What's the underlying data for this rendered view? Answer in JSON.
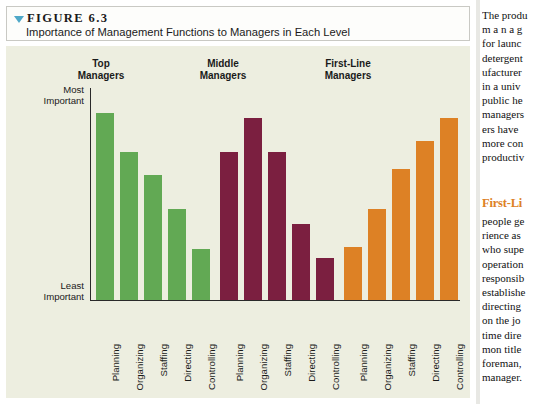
{
  "figure": {
    "label": "FIGURE 6.3",
    "caption": "Importance of Management Functions to Managers in Each Level",
    "disclosure_icon": "triangle-down-icon"
  },
  "colors": {
    "green": "#62a954",
    "maroon": "#7b1f40",
    "orange": "#dd8125",
    "panel_bg": "#edeee0",
    "accent_triangle": "#4fa8c8",
    "heading_orange": "#dd8125"
  },
  "chart_data": {
    "type": "bar",
    "title": "Importance of Management Functions to Managers in Each Level",
    "xlabel": "",
    "ylabel": "",
    "ylim": [
      0,
      100
    ],
    "grid": false,
    "legend": "none",
    "y_axis_ticks": [
      {
        "pos": "top",
        "line1": "Most",
        "line2": "Important"
      },
      {
        "pos": "bottom",
        "line1": "Least",
        "line2": "Important"
      }
    ],
    "categories": [
      "Planning",
      "Organizing",
      "Staffing",
      "Directing",
      "Controlling"
    ],
    "groups": [
      {
        "name": "Top Managers",
        "heading_line1": "Top",
        "heading_line2": "Managers",
        "color": "#62a954",
        "values": [
          88,
          70,
          59,
          43,
          24
        ]
      },
      {
        "name": "Middle Managers",
        "heading_line1": "Middle",
        "heading_line2": "Managers",
        "color": "#7b1f40",
        "values": [
          70,
          86,
          70,
          36,
          20
        ]
      },
      {
        "name": "First-Line Managers",
        "heading_line1": "First-Line",
        "heading_line2": "Managers",
        "color": "#dd8125",
        "values": [
          25,
          43,
          62,
          75,
          86
        ]
      }
    ]
  },
  "sidebar_text": {
    "paragraph1": [
      "The produ",
      "m a n a g",
      "for  launc",
      "detergent",
      "ufacturer",
      "in a univ",
      "public he",
      "managers",
      "ers  have",
      "more  con",
      "productiv"
    ],
    "heading": "First-Li",
    "paragraph2": [
      "people ge",
      "rience  as",
      "who  supe",
      "operation",
      "responsib",
      "establishe",
      "directing",
      "on  the  jo",
      "time  dire",
      "mon  title",
      "foreman,",
      "manager."
    ]
  }
}
